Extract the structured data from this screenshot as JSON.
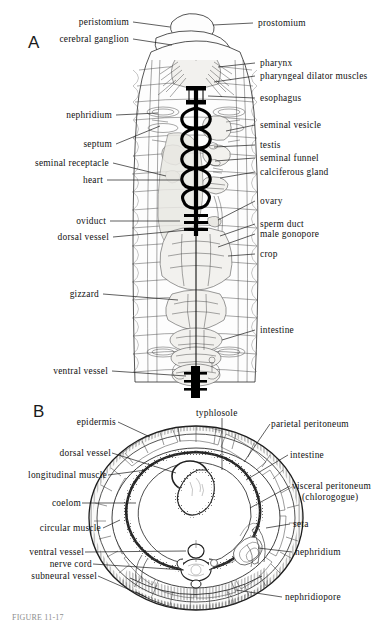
{
  "figure": {
    "panels": [
      {
        "letter": "A",
        "description": "dorsal dissection of earthworm anterior"
      },
      {
        "letter": "B",
        "description": "transverse section of earthworm"
      }
    ],
    "clipped_caption": "FIGURE 11-17"
  },
  "panel_a": {
    "letter": "A",
    "labels_left": [
      {
        "text": "peristomium",
        "id": "peristomium"
      },
      {
        "text": "cerebral ganglion",
        "id": "cerebral-ganglion"
      },
      {
        "text": "nephridium",
        "id": "nephridium"
      },
      {
        "text": "septum",
        "id": "septum"
      },
      {
        "text": "seminal receptacle",
        "id": "seminal-receptacle"
      },
      {
        "text": "heart",
        "id": "heart"
      },
      {
        "text": "oviduct",
        "id": "oviduct"
      },
      {
        "text": "dorsal vessel",
        "id": "dorsal-vessel"
      },
      {
        "text": "gizzard",
        "id": "gizzard"
      },
      {
        "text": "ventral vessel",
        "id": "ventral-vessel"
      }
    ],
    "labels_right": [
      {
        "text": "prostomium",
        "id": "prostomium"
      },
      {
        "text": "pharynx",
        "id": "pharynx"
      },
      {
        "text": "pharyngeal dilator muscles",
        "id": "pharyngeal-dilator-muscles"
      },
      {
        "text": "esophagus",
        "id": "esophagus"
      },
      {
        "text": "seminal vesicle",
        "id": "seminal-vesicle"
      },
      {
        "text": "testis",
        "id": "testis"
      },
      {
        "text": "seminal funnel",
        "id": "seminal-funnel"
      },
      {
        "text": "calciferous gland",
        "id": "calciferous-gland"
      },
      {
        "text": "ovary",
        "id": "ovary"
      },
      {
        "text": "sperm duct",
        "id": "sperm-duct"
      },
      {
        "text": "male gonopore",
        "id": "male-gonopore"
      },
      {
        "text": "crop",
        "id": "crop"
      },
      {
        "text": "intestine",
        "id": "intestine"
      }
    ]
  },
  "panel_b": {
    "letter": "B",
    "label_top": {
      "text": "typhlosole",
      "id": "typhlosole"
    },
    "labels_left": [
      {
        "text": "epidermis",
        "id": "epidermis"
      },
      {
        "text": "dorsal vessel",
        "id": "dorsal-vessel-b"
      },
      {
        "text": "longitudinal muscle",
        "id": "longitudinal-muscle"
      },
      {
        "text": "coelom",
        "id": "coelom"
      },
      {
        "text": "circular muscle",
        "id": "circular-muscle"
      },
      {
        "text": "ventral vessel",
        "id": "ventral-vessel-b"
      },
      {
        "text": "nerve cord",
        "id": "nerve-cord"
      },
      {
        "text": "subneural vessel",
        "id": "subneural-vessel"
      }
    ],
    "labels_right": [
      {
        "text": "parietal peritoneum",
        "id": "parietal-peritoneum"
      },
      {
        "text": "intestine",
        "id": "intestine-b"
      },
      {
        "text": "visceral peritoneum",
        "id": "visceral-peritoneum",
        "sub": "(chlorogogue)"
      },
      {
        "text": "seta",
        "id": "seta"
      },
      {
        "text": "nephridium",
        "id": "nephridium-b"
      },
      {
        "text": "nephridiopore",
        "id": "nephridiopore"
      }
    ]
  },
  "colors": {
    "ink": "#1b1b1b",
    "background": "#ffffff",
    "organ_fill": "#f2f1ee",
    "vessel_black": "#000000"
  }
}
